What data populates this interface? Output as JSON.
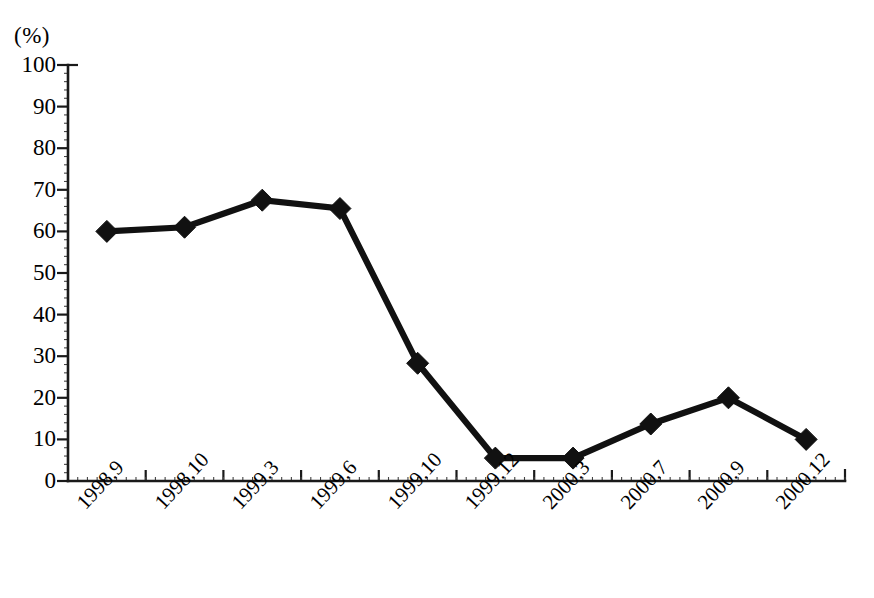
{
  "chart_data": {
    "type": "line",
    "title": "",
    "subtitle": "",
    "xlabel": "",
    "ylabel": "(%)",
    "y_unit_caption": "(%)",
    "categories": [
      "1998.9",
      "1998.10",
      "1999.3",
      "1999.6",
      "1999.10",
      "1999.12",
      "2000.3",
      "2000.7",
      "2000.9",
      "2000.12"
    ],
    "values": [
      60,
      61,
      67.5,
      65.5,
      28.3,
      5.5,
      5.5,
      13.7,
      20,
      10
    ],
    "series": [
      {
        "name": "",
        "values": [
          60,
          61,
          67.5,
          65.5,
          28.3,
          5.5,
          5.5,
          13.7,
          20,
          10
        ],
        "marker": "diamond",
        "color": "#111111"
      }
    ],
    "ylim": [
      0,
      100
    ],
    "y_ticks": [
      0,
      10,
      20,
      30,
      40,
      50,
      60,
      70,
      80,
      90,
      100
    ],
    "y_tick_labels": [
      "0",
      "10",
      "20",
      "30",
      "40",
      "50",
      "60",
      "70",
      "80",
      "90",
      "100"
    ],
    "grid": false,
    "legend": false,
    "legend_position": "none",
    "x_tick_label_rotation": -47,
    "annotations": []
  },
  "colors": {
    "background": "#ffffff",
    "axis": "#1a1a1a",
    "series": "#111111"
  }
}
